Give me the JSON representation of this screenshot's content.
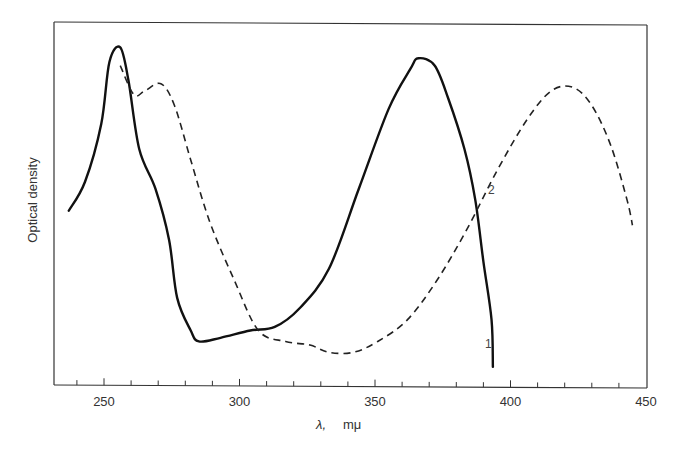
{
  "chart_data": {
    "type": "line",
    "title": "",
    "xlabel": "λ,   mμ",
    "ylabel": "Optical density",
    "xlim": [
      232,
      450
    ],
    "ylim": [
      0,
      1
    ],
    "x_ticks": [
      250,
      300,
      350,
      400,
      450
    ],
    "x_tick_labels": [
      "250",
      "300",
      "350",
      "400",
      "450"
    ],
    "minor_tick_step": 10,
    "grid": false,
    "y_ticks_shown": false,
    "legend": "inline curve labels",
    "series": [
      {
        "name": "1",
        "style": "solid",
        "x": [
          237,
          243,
          249,
          252,
          256,
          259,
          263,
          269,
          274,
          277,
          282,
          285,
          293,
          304,
          313,
          322,
          333,
          344,
          355,
          363,
          366,
          372,
          377,
          383,
          387,
          390,
          393,
          393.5
        ],
        "y": [
          0.48,
          0.56,
          0.72,
          0.89,
          0.93,
          0.84,
          0.65,
          0.54,
          0.4,
          0.24,
          0.15,
          0.12,
          0.13,
          0.15,
          0.16,
          0.21,
          0.32,
          0.54,
          0.76,
          0.87,
          0.9,
          0.88,
          0.79,
          0.65,
          0.51,
          0.34,
          0.18,
          0.05
        ]
      },
      {
        "name": "2",
        "style": "dashed",
        "x": [
          256,
          261,
          265,
          271,
          276,
          282,
          289,
          298,
          307,
          317,
          326,
          333,
          342,
          351,
          362,
          373,
          384,
          395,
          406,
          415,
          423,
          430,
          437,
          443,
          445
        ],
        "y": [
          0.88,
          0.8,
          0.81,
          0.83,
          0.77,
          0.62,
          0.45,
          0.29,
          0.15,
          0.12,
          0.11,
          0.09,
          0.09,
          0.12,
          0.18,
          0.29,
          0.43,
          0.59,
          0.73,
          0.81,
          0.82,
          0.77,
          0.66,
          0.51,
          0.44
        ]
      }
    ],
    "annotations": [
      {
        "text": "1",
        "near": "solid curve at ~392 mμ"
      },
      {
        "text": "2",
        "near": "dashed curve at ~390 mμ"
      }
    ]
  },
  "labels": {
    "ylabel": "Optical density",
    "xlabel_symbol": "λ,",
    "xlabel_unit": "mμ",
    "curve1": "1",
    "curve2": "2",
    "ticks": [
      "250",
      "300",
      "350",
      "400",
      "450"
    ]
  }
}
